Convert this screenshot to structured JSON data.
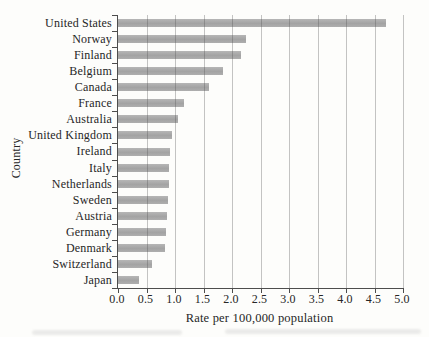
{
  "figure": {
    "background": "#fdfdfb",
    "bar_color": "#a3a3a3",
    "grid_color": "#b5b5b5",
    "axis_color": "#4d4d4d",
    "text_color": "#262626"
  },
  "chart_data": {
    "type": "bar",
    "orientation": "horizontal",
    "title": "",
    "xlabel": "Rate per 100,000 population",
    "ylabel": "Country",
    "xlim": [
      0,
      5
    ],
    "xticks": [
      0,
      0.5,
      1,
      1.5,
      2,
      2.5,
      3,
      3.5,
      4,
      4.5,
      5
    ],
    "xtick_labels": [
      "0.0",
      "0.5",
      "1.0",
      "1.5",
      "2.0",
      "2.5",
      "3.0",
      "3.5",
      "4.0",
      "4.5",
      "5.0"
    ],
    "grid": "vertical",
    "legend": "none",
    "categories": [
      "United States",
      "Norway",
      "Finland",
      "Belgium",
      "Canada",
      "France",
      "Australia",
      "United Kingdom",
      "Ireland",
      "Italy",
      "Netherlands",
      "Sweden",
      "Austria",
      "Germany",
      "Denmark",
      "Switzerland",
      "Japan"
    ],
    "values": [
      4.7,
      2.25,
      2.15,
      1.85,
      1.6,
      1.15,
      1.05,
      0.95,
      0.92,
      0.9,
      0.9,
      0.87,
      0.86,
      0.84,
      0.82,
      0.6,
      0.36
    ]
  }
}
